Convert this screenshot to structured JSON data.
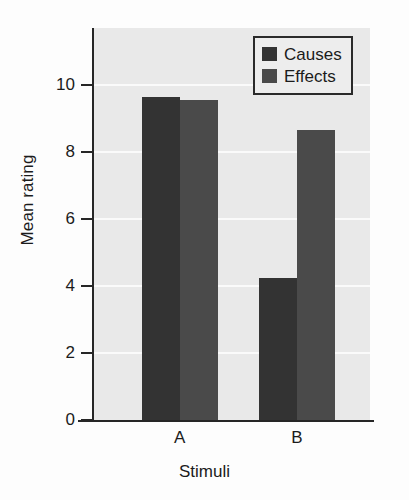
{
  "chart_data": {
    "type": "bar",
    "title": "",
    "xlabel": "Stimuli",
    "ylabel": "Mean rating",
    "categories": [
      "A",
      "B"
    ],
    "series": [
      {
        "name": "Causes",
        "values": [
          9.65,
          4.25
        ],
        "color": "#333333"
      },
      {
        "name": "Effects",
        "values": [
          9.55,
          8.65
        ],
        "color": "#4a4a4a"
      }
    ],
    "ylim": [
      0,
      11.7
    ],
    "yticks": [
      0,
      2,
      4,
      6,
      8,
      10
    ],
    "ytick_labels": [
      "0",
      "2",
      "4",
      "6",
      "8",
      "10"
    ],
    "grid": true,
    "grid_color": "#fafafa",
    "legend_position": "top-right",
    "plot_background": "#e9e9e9",
    "axis_color": "#262626"
  },
  "legend": {
    "entries": [
      {
        "label": "Causes",
        "color": "#333333"
      },
      {
        "label": "Effects",
        "color": "#4a4a4a"
      }
    ]
  },
  "axes": {
    "y_title": "Mean rating",
    "x_title": "Stimuli"
  }
}
